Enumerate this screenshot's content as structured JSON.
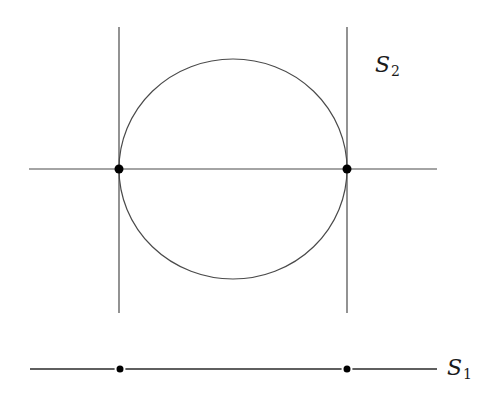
{
  "diagram": {
    "labels": {
      "s2": {
        "base": "S",
        "sub": "2"
      },
      "s1": {
        "base": "S",
        "sub": "1"
      }
    },
    "colors": {
      "line": "#4a4a4a",
      "point": "#000000",
      "background": "#ffffff"
    },
    "upper_figure": {
      "vertical_lines": [
        {
          "x": 119,
          "y1": 27,
          "y2": 313
        },
        {
          "x": 347,
          "y1": 27,
          "y2": 313
        }
      ],
      "horizontal_line": {
        "y": 169,
        "x1": 29,
        "x2": 437
      },
      "circle": {
        "cx": 233,
        "cy": 169,
        "rx": 114,
        "ry": 110
      },
      "points": [
        {
          "x": 119,
          "y": 169
        },
        {
          "x": 347,
          "y": 169
        }
      ]
    },
    "lower_figure": {
      "line": {
        "y": 369,
        "x1": 30,
        "x2": 437
      },
      "points": [
        {
          "x": 120,
          "y": 369
        },
        {
          "x": 347,
          "y": 369
        }
      ]
    }
  }
}
